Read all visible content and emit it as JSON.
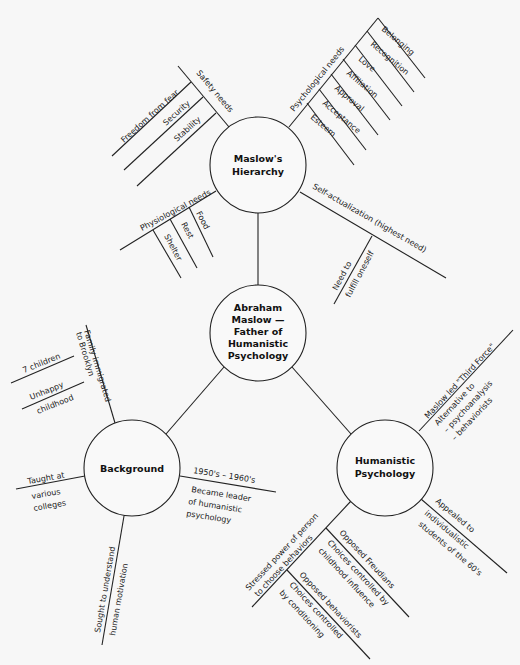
{
  "diagram": {
    "type": "mind-map",
    "center": {
      "lines": [
        "Abraham",
        "Maslow —",
        "Father of",
        "Humanistic",
        "Psychology"
      ]
    },
    "maslow": {
      "lines": [
        "Maslow's",
        "Hierarchy"
      ],
      "safety": {
        "label": "Safety needs",
        "items": [
          "Freedom from fear",
          "Security",
          "Stability"
        ]
      },
      "psychological": {
        "label": "Psychological needs",
        "items": [
          "Belonging",
          "Recognition",
          "Love",
          "Affiliation",
          "Approval",
          "Acceptance",
          "Esteem"
        ]
      },
      "physiological": {
        "label": "Physiological needs",
        "items": [
          "Food",
          "Rest",
          "Shelter"
        ]
      },
      "self_actualization": {
        "label": "Self-actualization (highest need)",
        "sub": [
          "Need to",
          "fulfill oneself"
        ]
      }
    },
    "background": {
      "lines": [
        "Background"
      ],
      "family": {
        "label": [
          "Family immigrated",
          "to Brooklyn"
        ],
        "items": [
          "7 children",
          "Unhappy",
          "childhood"
        ]
      },
      "taught": [
        "Taught at",
        "various",
        "colleges"
      ],
      "sought": [
        "Sought to understand",
        "human motivation"
      ],
      "leader": {
        "label": "1950's – 1960's",
        "sub": [
          "Became leader",
          "of humanistic",
          "psychology"
        ]
      }
    },
    "humanistic": {
      "lines": [
        "Humanistic",
        "Psychology"
      ],
      "third_force": {
        "label": "Maslow led \"Third Force\"",
        "sub": [
          "Alternative to",
          "– psychoanalysis",
          "– behaviorists"
        ]
      },
      "appealed": {
        "label": "Appealed to",
        "sub": [
          "individualistic",
          "students of the 60's"
        ]
      },
      "stressed": {
        "label": [
          "Stressed power of person",
          "to choose behaviors"
        ],
        "freudians": {
          "label": "Opposed Freudians",
          "sub": [
            "Choices controlled by",
            "childhood influence"
          ]
        },
        "behaviorists": {
          "label": "Opposed behaviorists",
          "sub": [
            "Choices controlled",
            "by conditioning"
          ]
        }
      }
    }
  }
}
